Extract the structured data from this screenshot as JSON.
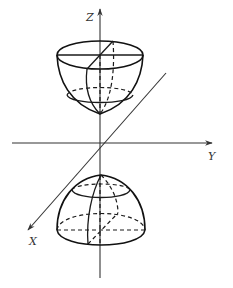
{
  "figure": {
    "type": "3d-coordinate-sketch",
    "axes": {
      "z_label": "Z",
      "y_label": "Y",
      "x_label": "X"
    },
    "colors": {
      "stroke": "#1a1a1a",
      "background": "#ffffff"
    },
    "parts": [
      {
        "name": "upper-bowl",
        "features": [
          "solid rim ellipse",
          "dashed inner cross-section ellipse",
          "meridian curves"
        ]
      },
      {
        "name": "lower-dome",
        "features": [
          "solid top cap ellipse",
          "dashed base ellipse",
          "meridian curves"
        ]
      }
    ]
  }
}
